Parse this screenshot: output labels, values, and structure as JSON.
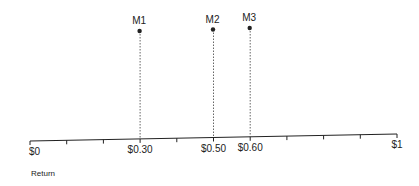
{
  "chart_data": {
    "type": "scatter",
    "title": "",
    "xlabel": "Return",
    "xlim": [
      0,
      1
    ],
    "tick_step": 0.1,
    "tick_labels": [
      {
        "value": 0,
        "label": "$0"
      },
      {
        "value": 0.3,
        "label": "$0.30"
      },
      {
        "value": 0.5,
        "label": "$0.50"
      },
      {
        "value": 0.6,
        "label": "$0.60"
      },
      {
        "value": 1,
        "label": "$1"
      }
    ],
    "points": [
      {
        "name": "M1",
        "x": 0.3
      },
      {
        "name": "M2",
        "x": 0.5
      },
      {
        "name": "M3",
        "x": 0.6
      }
    ],
    "colors": {
      "ink": "#222222",
      "dotted": "#555555"
    }
  }
}
